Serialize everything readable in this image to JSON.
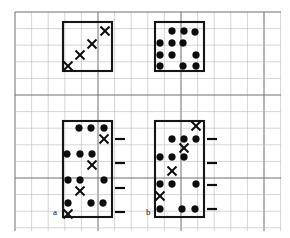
{
  "figure": {
    "canvas": {
      "width": 290,
      "height": 238,
      "background": "#ffffff"
    },
    "grid": {
      "minor_spacing": 16.6,
      "major_every": 5,
      "minor_color": "#b9b9bd",
      "major_color": "#6e6e76",
      "x_start": 15,
      "y_start": 12,
      "x_end": 281,
      "y_end": 231
    },
    "markers": {
      "dot": {
        "name": "filled-circle",
        "color": "#0d0d0d",
        "radius": 3.4
      },
      "cross": {
        "name": "x-cross",
        "color": "#0d0d0d",
        "size": 9
      },
      "tick": {
        "name": "horizontal-tick",
        "color": "#0d0d0d",
        "length": 10
      }
    },
    "panels": [
      {
        "id": "top-left",
        "label": "",
        "box": {
          "x": 63,
          "y": 22,
          "width": 49,
          "height": 49
        },
        "dots": [],
        "crosses": [
          {
            "x": 68,
            "y": 66
          },
          {
            "x": 80,
            "y": 55
          },
          {
            "x": 92,
            "y": 44
          },
          {
            "x": 105,
            "y": 31
          }
        ],
        "ticks": []
      },
      {
        "id": "top-right",
        "label": "",
        "box": {
          "x": 155,
          "y": 22,
          "width": 49,
          "height": 49
        },
        "dots": [
          {
            "x": 172,
            "y": 31
          },
          {
            "x": 184,
            "y": 31
          },
          {
            "x": 195,
            "y": 32
          },
          {
            "x": 160,
            "y": 43
          },
          {
            "x": 172,
            "y": 43
          },
          {
            "x": 183,
            "y": 43
          },
          {
            "x": 160,
            "y": 55
          },
          {
            "x": 172,
            "y": 55
          },
          {
            "x": 196,
            "y": 55
          },
          {
            "x": 160,
            "y": 66
          },
          {
            "x": 183,
            "y": 66
          },
          {
            "x": 196,
            "y": 66
          }
        ],
        "crosses": [],
        "ticks": []
      },
      {
        "id": "bottom-left",
        "label": "a",
        "label_pos": {
          "x": 53,
          "y": 215
        },
        "box": {
          "x": 63,
          "y": 121,
          "width": 49,
          "height": 96
        },
        "dots": [
          {
            "x": 79,
            "y": 128
          },
          {
            "x": 91,
            "y": 128
          },
          {
            "x": 104,
            "y": 128
          },
          {
            "x": 67,
            "y": 154
          },
          {
            "x": 80,
            "y": 154
          },
          {
            "x": 92,
            "y": 154
          },
          {
            "x": 68,
            "y": 180
          },
          {
            "x": 80,
            "y": 180
          },
          {
            "x": 104,
            "y": 180
          },
          {
            "x": 68,
            "y": 203
          },
          {
            "x": 91,
            "y": 203
          },
          {
            "x": 103,
            "y": 203
          }
        ],
        "crosses": [
          {
            "x": 104,
            "y": 139
          },
          {
            "x": 92,
            "y": 165
          },
          {
            "x": 80,
            "y": 191
          },
          {
            "x": 68,
            "y": 214
          }
        ],
        "ticks": [
          {
            "x": 115,
            "y": 139
          },
          {
            "x": 115,
            "y": 163
          },
          {
            "x": 115,
            "y": 188
          },
          {
            "x": 115,
            "y": 212
          }
        ]
      },
      {
        "id": "bottom-right",
        "label": "b",
        "label_pos": {
          "x": 146,
          "y": 215
        },
        "box": {
          "x": 155,
          "y": 121,
          "width": 49,
          "height": 96
        },
        "dots": [
          {
            "x": 172,
            "y": 139
          },
          {
            "x": 184,
            "y": 139
          },
          {
            "x": 196,
            "y": 139
          },
          {
            "x": 160,
            "y": 157
          },
          {
            "x": 172,
            "y": 157
          },
          {
            "x": 184,
            "y": 157
          },
          {
            "x": 160,
            "y": 184
          },
          {
            "x": 172,
            "y": 184
          },
          {
            "x": 196,
            "y": 184
          },
          {
            "x": 160,
            "y": 209
          },
          {
            "x": 182,
            "y": 209
          },
          {
            "x": 195,
            "y": 209
          }
        ],
        "crosses": [
          {
            "x": 196,
            "y": 126
          },
          {
            "x": 184,
            "y": 148
          },
          {
            "x": 172,
            "y": 171
          },
          {
            "x": 160,
            "y": 196
          }
        ],
        "ticks": [
          {
            "x": 207,
            "y": 139
          },
          {
            "x": 207,
            "y": 163
          },
          {
            "x": 207,
            "y": 185
          },
          {
            "x": 207,
            "y": 209
          }
        ]
      }
    ]
  }
}
